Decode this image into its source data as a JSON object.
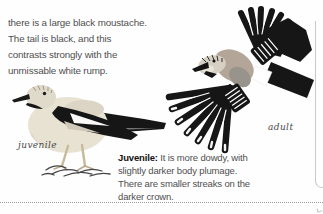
{
  "page": {
    "top_paragraph": {
      "lines": [
        "there is a large black moustache.",
        "The tail is black, and this",
        "contrasts strongly with the",
        "unmissable white rump."
      ]
    },
    "bottom_paragraph": {
      "bold_label": "Juvenile:",
      "line1_rest": " It is more dowdy, with",
      "lines": [
        "slightly darker body plumage.",
        "There are smaller streaks on the",
        "darker crown."
      ]
    },
    "figure_labels": {
      "left": "juvenile",
      "right": "adult"
    },
    "illustrations": {
      "left": "standing-juvenile-bird",
      "right": "flying-adult-bird"
    },
    "colors": {
      "body_text": "#4f4f4f",
      "bold_text": "#111111",
      "caption_text": "#4a4a4a",
      "bird_black": "#161616",
      "juvenile_body": "#e8e2d3",
      "adult_body": "#b3a698",
      "dotted_rule": "#9a9a9a",
      "panel_edge": "#c9c9c9"
    }
  }
}
